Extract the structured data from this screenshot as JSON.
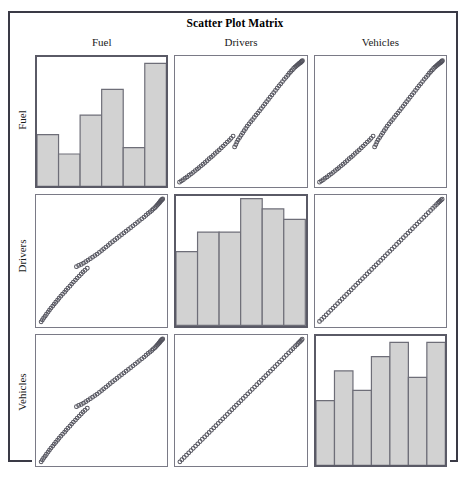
{
  "figure": {
    "title": "Scatter Plot Matrix",
    "variables": [
      "Fuel",
      "Drivers",
      "Vehicles"
    ],
    "colors": {
      "frame": "#3a3a46",
      "panel_border": "#7a7a86",
      "diagonal_panel_border": "#5a5a66",
      "bar_fill": "#d2d2d2",
      "bar_stroke": "#6e6e78",
      "marker_stroke": "#55555f",
      "background": "#ffffff"
    }
  },
  "column_headers": [
    {
      "label": "Fuel"
    },
    {
      "label": "Drivers"
    },
    {
      "label": "Vehicles"
    }
  ],
  "row_labels": [
    {
      "label": "Fuel"
    },
    {
      "label": "Drivers"
    },
    {
      "label": "Vehicles"
    }
  ],
  "chart_data": {
    "type": "scatter",
    "title": "Scatter Plot Matrix",
    "xlabel": "",
    "ylabel": "",
    "grid": false,
    "legend_position": "none",
    "layout": {
      "kind": "scatter-plot-matrix",
      "rows": 3,
      "cols": 3,
      "diagonal": "histogram",
      "off_diagonal": "scatter",
      "marker": "open-circle",
      "marker_size_px": 3
    },
    "variables": [
      "Fuel",
      "Drivers",
      "Vehicles"
    ],
    "axis_ranges": {
      "Fuel": [
        0,
        1
      ],
      "Drivers": [
        0,
        1
      ],
      "Vehicles": [
        0,
        1
      ]
    },
    "panels": [
      {
        "row": "Fuel",
        "col": "Fuel",
        "panel_type": "histogram",
        "variable": "Fuel",
        "bins": 6,
        "values": [
          40,
          25,
          55,
          75,
          30,
          95
        ],
        "value_units": "percent-of-panel-height"
      },
      {
        "row": "Fuel",
        "col": "Drivers",
        "panel_type": "scatter",
        "x": "Drivers",
        "y": "Fuel",
        "relationship": "strong positive",
        "notes": "dense diagonal band with tight cluster at top-right"
      },
      {
        "row": "Fuel",
        "col": "Vehicles",
        "panel_type": "scatter",
        "x": "Vehicles",
        "y": "Fuel",
        "relationship": "strong positive",
        "notes": "dense diagonal band with tight cluster at top-right"
      },
      {
        "row": "Drivers",
        "col": "Fuel",
        "panel_type": "scatter",
        "x": "Fuel",
        "y": "Drivers",
        "relationship": "strong positive",
        "notes": "transpose of Fuel-vs-Drivers panel"
      },
      {
        "row": "Drivers",
        "col": "Drivers",
        "panel_type": "histogram",
        "variable": "Drivers",
        "bins": 6,
        "values": [
          57,
          72,
          72,
          98,
          90,
          82
        ],
        "value_units": "percent-of-panel-height"
      },
      {
        "row": "Drivers",
        "col": "Vehicles",
        "panel_type": "scatter",
        "x": "Vehicles",
        "y": "Drivers",
        "relationship": "near-perfect positive linear",
        "notes": "points lie almost exactly on the diagonal"
      },
      {
        "row": "Vehicles",
        "col": "Fuel",
        "panel_type": "scatter",
        "x": "Fuel",
        "y": "Vehicles",
        "relationship": "strong positive",
        "notes": "transpose of Fuel-vs-Vehicles panel"
      },
      {
        "row": "Vehicles",
        "col": "Drivers",
        "panel_type": "scatter",
        "x": "Drivers",
        "y": "Vehicles",
        "relationship": "near-perfect positive linear",
        "notes": "points lie almost exactly on the diagonal"
      },
      {
        "row": "Vehicles",
        "col": "Vehicles",
        "panel_type": "histogram",
        "variable": "Vehicles",
        "bins": 7,
        "values": [
          50,
          73,
          58,
          84,
          95,
          68,
          95
        ],
        "value_units": "percent-of-panel-height"
      }
    ],
    "scatter_points": {
      "description": "Normalized 0-1 coordinates of the common monotone point cloud shared by the off-diagonal panels (x = predictor, y = response).",
      "fuel_vs_drivers": [
        [
          0.015,
          0.02
        ],
        [
          0.03,
          0.03
        ],
        [
          0.045,
          0.04
        ],
        [
          0.06,
          0.052
        ],
        [
          0.075,
          0.062
        ],
        [
          0.092,
          0.075
        ],
        [
          0.108,
          0.086
        ],
        [
          0.124,
          0.098
        ],
        [
          0.14,
          0.112
        ],
        [
          0.156,
          0.124
        ],
        [
          0.17,
          0.136
        ],
        [
          0.186,
          0.15
        ],
        [
          0.202,
          0.162
        ],
        [
          0.218,
          0.176
        ],
        [
          0.234,
          0.19
        ],
        [
          0.25,
          0.206
        ],
        [
          0.266,
          0.218
        ],
        [
          0.282,
          0.232
        ],
        [
          0.298,
          0.248
        ],
        [
          0.314,
          0.262
        ],
        [
          0.33,
          0.276
        ],
        [
          0.346,
          0.292
        ],
        [
          0.362,
          0.306
        ],
        [
          0.378,
          0.322
        ],
        [
          0.394,
          0.338
        ],
        [
          0.41,
          0.352
        ],
        [
          0.424,
          0.368
        ],
        [
          0.44,
          0.386
        ],
        [
          0.452,
          0.3
        ],
        [
          0.462,
          0.318
        ],
        [
          0.47,
          0.338
        ],
        [
          0.48,
          0.356
        ],
        [
          0.492,
          0.374
        ],
        [
          0.504,
          0.392
        ],
        [
          0.516,
          0.41
        ],
        [
          0.528,
          0.428
        ],
        [
          0.54,
          0.446
        ],
        [
          0.552,
          0.464
        ],
        [
          0.566,
          0.482
        ],
        [
          0.58,
          0.5
        ],
        [
          0.594,
          0.516
        ],
        [
          0.608,
          0.534
        ],
        [
          0.622,
          0.552
        ],
        [
          0.636,
          0.568
        ],
        [
          0.65,
          0.586
        ],
        [
          0.664,
          0.604
        ],
        [
          0.678,
          0.622
        ],
        [
          0.692,
          0.64
        ],
        [
          0.706,
          0.658
        ],
        [
          0.72,
          0.676
        ],
        [
          0.734,
          0.694
        ],
        [
          0.748,
          0.712
        ],
        [
          0.762,
          0.73
        ],
        [
          0.776,
          0.748
        ],
        [
          0.79,
          0.766
        ],
        [
          0.804,
          0.784
        ],
        [
          0.818,
          0.8
        ],
        [
          0.832,
          0.818
        ],
        [
          0.846,
          0.836
        ],
        [
          0.86,
          0.852
        ],
        [
          0.874,
          0.868
        ],
        [
          0.886,
          0.884
        ],
        [
          0.898,
          0.898
        ],
        [
          0.91,
          0.91
        ],
        [
          0.92,
          0.922
        ],
        [
          0.93,
          0.932
        ],
        [
          0.94,
          0.94
        ],
        [
          0.948,
          0.948
        ],
        [
          0.956,
          0.954
        ],
        [
          0.962,
          0.96
        ],
        [
          0.968,
          0.964
        ],
        [
          0.974,
          0.968
        ],
        [
          0.978,
          0.972
        ],
        [
          0.982,
          0.976
        ],
        [
          0.986,
          0.98
        ],
        [
          0.99,
          0.984
        ]
      ],
      "drivers_vs_vehicles": [
        [
          0.015,
          0.018
        ],
        [
          0.032,
          0.034
        ],
        [
          0.05,
          0.052
        ],
        [
          0.068,
          0.07
        ],
        [
          0.086,
          0.088
        ],
        [
          0.104,
          0.106
        ],
        [
          0.122,
          0.124
        ],
        [
          0.14,
          0.142
        ],
        [
          0.158,
          0.16
        ],
        [
          0.176,
          0.178
        ],
        [
          0.194,
          0.196
        ],
        [
          0.212,
          0.214
        ],
        [
          0.23,
          0.232
        ],
        [
          0.248,
          0.25
        ],
        [
          0.266,
          0.268
        ],
        [
          0.284,
          0.286
        ],
        [
          0.302,
          0.304
        ],
        [
          0.32,
          0.322
        ],
        [
          0.338,
          0.34
        ],
        [
          0.356,
          0.358
        ],
        [
          0.374,
          0.376
        ],
        [
          0.392,
          0.394
        ],
        [
          0.41,
          0.412
        ],
        [
          0.428,
          0.43
        ],
        [
          0.446,
          0.448
        ],
        [
          0.464,
          0.466
        ],
        [
          0.482,
          0.484
        ],
        [
          0.5,
          0.502
        ],
        [
          0.518,
          0.52
        ],
        [
          0.536,
          0.538
        ],
        [
          0.554,
          0.556
        ],
        [
          0.572,
          0.574
        ],
        [
          0.59,
          0.592
        ],
        [
          0.608,
          0.61
        ],
        [
          0.626,
          0.628
        ],
        [
          0.644,
          0.646
        ],
        [
          0.662,
          0.664
        ],
        [
          0.68,
          0.682
        ],
        [
          0.698,
          0.7
        ],
        [
          0.716,
          0.718
        ],
        [
          0.734,
          0.736
        ],
        [
          0.752,
          0.754
        ],
        [
          0.77,
          0.772
        ],
        [
          0.788,
          0.79
        ],
        [
          0.806,
          0.808
        ],
        [
          0.824,
          0.826
        ],
        [
          0.842,
          0.844
        ],
        [
          0.86,
          0.862
        ],
        [
          0.878,
          0.88
        ],
        [
          0.896,
          0.898
        ],
        [
          0.912,
          0.914
        ],
        [
          0.928,
          0.93
        ],
        [
          0.942,
          0.944
        ],
        [
          0.954,
          0.956
        ],
        [
          0.964,
          0.966
        ],
        [
          0.972,
          0.974
        ],
        [
          0.98,
          0.982
        ],
        [
          0.988,
          0.988
        ]
      ]
    }
  }
}
